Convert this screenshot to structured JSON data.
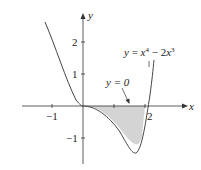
{
  "figure": {
    "function_label": {
      "y": "y",
      "eq": " = ",
      "x1": "x",
      "e1": "4",
      "minus": " − 2",
      "x2": "x",
      "e2": "3"
    },
    "line_label": "y = 0",
    "axes": {
      "x_label": "x",
      "y_label": "y",
      "x_ticks": [
        "−1",
        "2"
      ],
      "y_ticks": [
        "2",
        "1",
        "−1"
      ]
    },
    "colors": {
      "curve": "#444444",
      "fill": "#d4d4d4",
      "axis": "#333333"
    }
  }
}
